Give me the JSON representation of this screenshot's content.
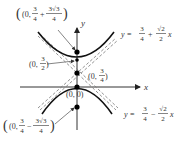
{
  "diagram": {
    "type": "hyperbola-with-asymptotes",
    "axes": {
      "x_label": "x",
      "y_label": "y"
    },
    "points": [
      {
        "id": "focus-upper",
        "label_prefix": "(0,",
        "frac1": {
          "num": "3",
          "den": "4"
        },
        "op": "+",
        "frac2": {
          "num": "3√3",
          "den": "4"
        },
        "label_suffix": ")"
      },
      {
        "id": "vertex-upper",
        "label_prefix": "(0,",
        "frac": {
          "num": "3",
          "den": "2"
        },
        "label_suffix": ")"
      },
      {
        "id": "center",
        "label_prefix": "(0,",
        "frac": {
          "num": "3",
          "den": "4"
        },
        "label_suffix": ")"
      },
      {
        "id": "vertex-lower",
        "label": "(0, 0)"
      },
      {
        "id": "focus-lower",
        "label_prefix": "(0,",
        "frac1": {
          "num": "3",
          "den": "4"
        },
        "op": "−",
        "frac2": {
          "num": "3√3",
          "den": "4"
        },
        "label_suffix": ")"
      }
    ],
    "asymptotes": [
      {
        "id": "asymptote-upper",
        "lhs": "y =",
        "frac1": {
          "num": "3",
          "den": "4"
        },
        "op": "+",
        "frac2": {
          "num": "√2",
          "den": "2"
        },
        "var": "x"
      },
      {
        "id": "asymptote-lower",
        "lhs": "y =",
        "frac1": {
          "num": "3",
          "den": "4"
        },
        "op": "−",
        "frac2": {
          "num": "√2",
          "den": "2"
        },
        "var": "x"
      }
    ],
    "colors": {
      "curve": "#111111",
      "axis": "#333333",
      "asymptote": "#777777",
      "point": "#000000",
      "leader": "#555555"
    }
  }
}
